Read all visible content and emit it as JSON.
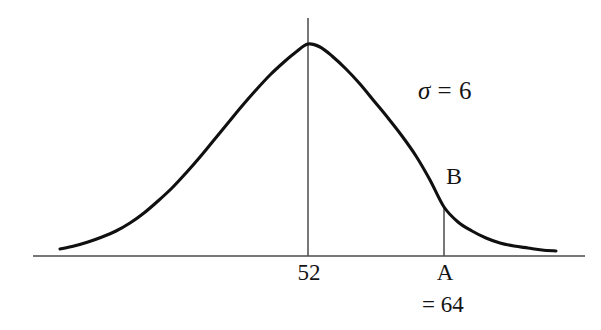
{
  "figure": {
    "background_color": "#ffffff",
    "curve_color": "#101010",
    "axis_color": "#4a4a4a",
    "text_color": "#141414"
  },
  "annotations": {
    "sigma_symbol": "σ",
    "sigma_equals": " = ",
    "sigma_value": "6",
    "point_b_label": "B",
    "point_a_label": "A",
    "point_a_value": "= 64",
    "mean_label": "52"
  },
  "chart_data": {
    "type": "line",
    "title": "",
    "subtitle": "",
    "xlabel": "",
    "ylabel": "",
    "grid": false,
    "legend_position": "none",
    "distribution": "normal",
    "mean": 52,
    "std_dev": 6,
    "annotated_points": [
      {
        "name": "A",
        "description": "x-axis location of the vertical drop line",
        "x_value": 64,
        "z_score": 2,
        "axis_label": "A",
        "value_label": "= 64"
      },
      {
        "name": "B",
        "description": "point where the vertical line at x = 64 meets the normal curve",
        "x_value": 64,
        "on_curve": true,
        "axis_label": "B"
      }
    ],
    "x_tick_labels": [
      "52",
      "A"
    ],
    "axis_pixel_geometry": {
      "baseline_y": 256,
      "axis_x_start": 33,
      "axis_x_end": 585,
      "peak_x": 308,
      "peak_y": 44,
      "curve_x_start": 60,
      "curve_x_end": 556,
      "mean_line_top_y": 18,
      "a_line_x": 444,
      "a_line_top_y": 207
    },
    "curve_points": [
      {
        "x": 60,
        "y": 249
      },
      {
        "x": 74,
        "y": 246
      },
      {
        "x": 88,
        "y": 242
      },
      {
        "x": 102,
        "y": 237
      },
      {
        "x": 116,
        "y": 231
      },
      {
        "x": 130,
        "y": 223
      },
      {
        "x": 144,
        "y": 213
      },
      {
        "x": 158,
        "y": 201
      },
      {
        "x": 172,
        "y": 188
      },
      {
        "x": 186,
        "y": 173
      },
      {
        "x": 200,
        "y": 157
      },
      {
        "x": 214,
        "y": 140
      },
      {
        "x": 228,
        "y": 123
      },
      {
        "x": 242,
        "y": 106
      },
      {
        "x": 256,
        "y": 90
      },
      {
        "x": 270,
        "y": 75
      },
      {
        "x": 284,
        "y": 62
      },
      {
        "x": 296,
        "y": 52
      },
      {
        "x": 308,
        "y": 44
      },
      {
        "x": 320,
        "y": 47
      },
      {
        "x": 332,
        "y": 56
      },
      {
        "x": 346,
        "y": 69
      },
      {
        "x": 360,
        "y": 84
      },
      {
        "x": 374,
        "y": 101
      },
      {
        "x": 388,
        "y": 118
      },
      {
        "x": 402,
        "y": 136
      },
      {
        "x": 416,
        "y": 156
      },
      {
        "x": 430,
        "y": 180
      },
      {
        "x": 444,
        "y": 207
      },
      {
        "x": 458,
        "y": 222
      },
      {
        "x": 472,
        "y": 231
      },
      {
        "x": 486,
        "y": 238
      },
      {
        "x": 500,
        "y": 243
      },
      {
        "x": 514,
        "y": 246
      },
      {
        "x": 528,
        "y": 248
      },
      {
        "x": 542,
        "y": 250
      },
      {
        "x": 556,
        "y": 251
      }
    ]
  }
}
